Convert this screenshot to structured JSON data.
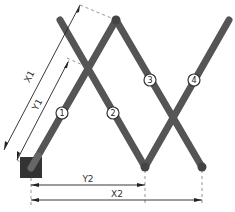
{
  "diagram": {
    "type": "scissor-linkage-mechanism",
    "colors": {
      "bar": "#555555",
      "anchor_block": "#333333",
      "dimension_line": "#222222",
      "extension_line": "#888888"
    },
    "anchor": {
      "label": "fixed-pivot-block"
    },
    "links": [
      {
        "id": "1",
        "label": "1"
      },
      {
        "id": "2",
        "label": "2"
      },
      {
        "id": "3",
        "label": "3"
      },
      {
        "id": "4",
        "label": "4"
      }
    ],
    "dimensions": {
      "x1": "X1",
      "y1": "Y1",
      "y2": "Y2",
      "x2": "X2"
    }
  }
}
